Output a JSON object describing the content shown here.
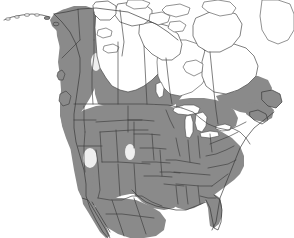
{
  "figure": {
    "kind": "range-map",
    "region": "North America",
    "title": "",
    "caption": "",
    "width_px": 294,
    "height_px": 238,
    "background_color": "#ffffff"
  },
  "legend": {
    "visible": false,
    "entries": [
      {
        "label": "",
        "swatch_color": "#8a8a8a",
        "meaning": "shaded distribution range"
      },
      {
        "label": "",
        "swatch_color": "#ffffff",
        "meaning": "outside range"
      }
    ]
  },
  "colors": {
    "range_fill": "#8a8a8a",
    "range_fill_dark": "#7e7e7e",
    "land_fill": "#ffffff",
    "water_fill": "#ffffff",
    "coast_stroke": "#3a3a3a",
    "border_stroke": "#3c3c3c",
    "outline_stroke": "#4a4a4a",
    "gap_fill": "#ffffff"
  },
  "map_content": {
    "shaded_regions": [
      "Alaska mainland",
      "Yukon",
      "western Northwest Territories",
      "British Columbia",
      "Alberta",
      "Saskatchewan",
      "Manitoba",
      "southern Ontario",
      "southern Quebec",
      "New Brunswick",
      "Nova Scotia",
      "Labrador",
      "Newfoundland",
      "contiguous United States",
      "northern Mexico",
      "Baja California"
    ],
    "unshaded_regions": [
      "Canadian Arctic Archipelago",
      "Hudson Bay surroundings",
      "Nunavut mainland",
      "northern Quebec",
      "Great Lakes",
      "Great Basin patches",
      "Aleutian Islands"
    ],
    "water_features": [
      "Hudson Bay",
      "Lake Superior",
      "Lake Michigan",
      "Lake Huron",
      "Lake Erie",
      "Lake Ontario",
      "Great Slave Lake",
      "Great Bear Lake",
      "Gulf of Mexico",
      "Pacific Ocean",
      "Atlantic Ocean"
    ]
  },
  "labels": {
    "country_labels": [],
    "state_labels": [],
    "scale_bar": "",
    "north_arrow": "",
    "attribution": ""
  }
}
